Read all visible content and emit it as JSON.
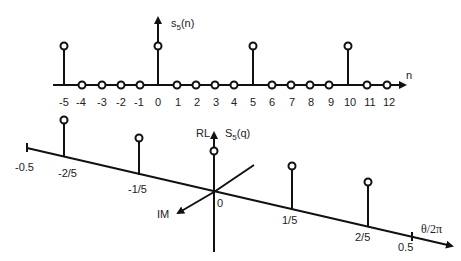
{
  "top_plot": {
    "axis_label_y": "s",
    "axis_label_y_sub": "5",
    "axis_label_y_arg": "(n)",
    "axis_label_x": "n",
    "ticks": [
      "-5",
      "-4",
      "-3",
      "-2",
      "-1",
      "0",
      "1",
      "2",
      "3",
      "4",
      "5",
      "6",
      "7",
      "8",
      "9",
      "10",
      "11",
      "12"
    ],
    "impulses_at": [
      -5,
      0,
      5,
      10
    ]
  },
  "bottom_plot": {
    "axis_label_real": "RL",
    "axis_label_imag": "IM",
    "axis_label_y": "S",
    "axis_label_y_sub": "5",
    "axis_label_y_arg": "(q)",
    "axis_label_x": "θ/2π",
    "origin_label": "0",
    "ticks": [
      "-0.5",
      "-2/5",
      "-1/5",
      "1/5",
      "2/5",
      "0.5"
    ],
    "impulses_at": [
      "-2/5",
      "-1/5",
      "0",
      "1/5",
      "2/5"
    ]
  }
}
